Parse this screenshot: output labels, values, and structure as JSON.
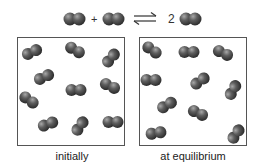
{
  "equation": {
    "reactant1": "diatomic-molecule",
    "plus": "+",
    "reactant2": "diatomic-molecule",
    "arrow": "equilibrium-arrows",
    "coefficient": "2",
    "product": "diatomic-molecule"
  },
  "panels": [
    {
      "label": "initially",
      "molecule_count": 12,
      "molecules": [
        {
          "x": 14,
          "y": 14,
          "angle": -25
        },
        {
          "x": 57,
          "y": 12,
          "angle": 30
        },
        {
          "x": 93,
          "y": 20,
          "angle": -50
        },
        {
          "x": 26,
          "y": 39,
          "angle": -25
        },
        {
          "x": 58,
          "y": 52,
          "angle": 0
        },
        {
          "x": 92,
          "y": 48,
          "angle": 25
        },
        {
          "x": 11,
          "y": 62,
          "angle": 35
        },
        {
          "x": 30,
          "y": 86,
          "angle": -20
        },
        {
          "x": 62,
          "y": 88,
          "angle": -55
        },
        {
          "x": 95,
          "y": 84,
          "angle": 0
        }
      ]
    },
    {
      "label": "at equilibrium",
      "molecule_count": 12,
      "molecules": [
        {
          "x": 12,
          "y": 12,
          "angle": 35
        },
        {
          "x": 49,
          "y": 14,
          "angle": 0
        },
        {
          "x": 83,
          "y": 15,
          "angle": 25
        },
        {
          "x": 11,
          "y": 42,
          "angle": 0
        },
        {
          "x": 60,
          "y": 43,
          "angle": -35
        },
        {
          "x": 93,
          "y": 52,
          "angle": -60
        },
        {
          "x": 27,
          "y": 67,
          "angle": -30
        },
        {
          "x": 58,
          "y": 75,
          "angle": 25
        },
        {
          "x": 16,
          "y": 95,
          "angle": -10
        },
        {
          "x": 96,
          "y": 96,
          "angle": -55
        }
      ]
    }
  ],
  "colors": {
    "atom": "#5a5a5a",
    "atom_highlight": "#9a9a9a",
    "atom_shadow": "#2e2e2e",
    "border": "#555555"
  }
}
